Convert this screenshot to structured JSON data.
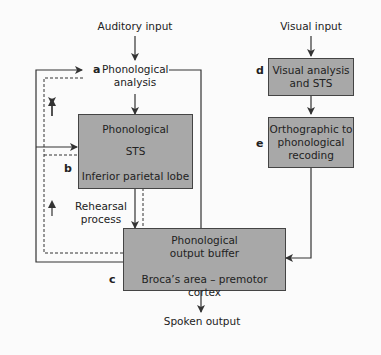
{
  "diagram": {
    "inputs": {
      "auditory": "Auditory input",
      "visual": "Visual input"
    },
    "nodes": {
      "a": {
        "letter": "a",
        "line1": "Phonological",
        "line2": "analysis"
      },
      "b": {
        "letter": "b",
        "line1": "Phonological",
        "line2": "STS",
        "line3": "Inferior parietal lobe"
      },
      "c": {
        "letter": "c",
        "line1": "Phonological",
        "line2": "output buffer",
        "line3": "Broca’s area – premotor cortex"
      },
      "d": {
        "letter": "d",
        "line1": "Visual analysis",
        "line2": "and STS"
      },
      "e": {
        "letter": "e",
        "line1": "Orthographic to",
        "line2": "phonological",
        "line3": "recoding"
      }
    },
    "rehearsal": {
      "line1": "Rehearsal",
      "line2": "process"
    },
    "output": "Spoken output",
    "colors": {
      "box_fill": "#a8a8a8",
      "box_border": "#444444",
      "line": "#333333",
      "background": "#fbfbfb"
    }
  }
}
